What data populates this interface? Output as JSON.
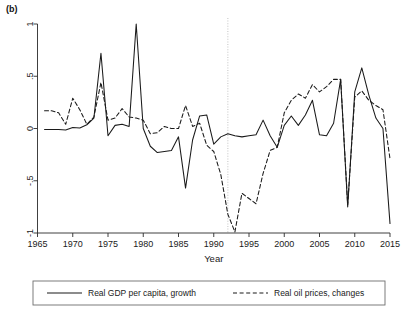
{
  "panel": {
    "label": "(b)"
  },
  "chart_data": {
    "type": "line",
    "title": "",
    "xlabel": "Year",
    "ylabel": "",
    "xlim": [
      1965,
      2015
    ],
    "ylim": [
      -1,
      1
    ],
    "grid": false,
    "legend_position": "bottom",
    "xticks": [
      1965,
      1970,
      1975,
      1980,
      1985,
      1990,
      1995,
      2000,
      2005,
      2010,
      2015
    ],
    "xtick_labels": [
      "1965",
      "1970",
      "1975",
      "1980",
      "1985",
      "1990",
      "1995",
      "2000",
      "2005",
      "2010",
      "2015"
    ],
    "yticks": [
      1,
      0.5,
      0,
      -0.5,
      -1
    ],
    "ytick_labels": [
      "1",
      ".5",
      "0",
      "-.5",
      "-1"
    ],
    "annotations": [
      {
        "name": "reference-line-1992",
        "type": "vline",
        "x": 1992,
        "style": "dotted",
        "color": "#c8c8c8"
      }
    ],
    "x": [
      1966,
      1967,
      1968,
      1969,
      1970,
      1971,
      1972,
      1973,
      1974,
      1975,
      1976,
      1977,
      1978,
      1979,
      1980,
      1981,
      1982,
      1983,
      1984,
      1985,
      1986,
      1987,
      1988,
      1989,
      1990,
      1991,
      1992,
      1993,
      1994,
      1995,
      1996,
      1997,
      1998,
      1999,
      2000,
      2001,
      2002,
      2003,
      2004,
      2005,
      2006,
      2007,
      2008,
      2009,
      2010,
      2011,
      2012,
      2013,
      2014,
      2015
    ],
    "series": [
      {
        "name": "Real GDP per capita, growth",
        "style": "solid",
        "color": "#1a1a1a",
        "values": [
          -0.01,
          -0.01,
          -0.01,
          -0.015,
          0.01,
          0.005,
          0.035,
          0.1,
          0.72,
          -0.07,
          0.03,
          0.04,
          0.02,
          1.0,
          0.0,
          -0.17,
          -0.23,
          -0.22,
          -0.21,
          -0.08,
          -0.57,
          -0.11,
          0.12,
          0.13,
          -0.15,
          -0.08,
          -0.05,
          -0.07,
          -0.08,
          -0.07,
          -0.06,
          0.08,
          -0.07,
          -0.18,
          0.03,
          0.12,
          0.03,
          0.13,
          0.27,
          -0.06,
          -0.07,
          0.05,
          0.16,
          0.25,
          0.35,
          0.23,
          0.2,
          0.13,
          0.47,
          -0.75
        ]
      },
      {
        "name": "Real oil prices, changes",
        "style": "dashed",
        "color": "#1a1a1a",
        "values": [
          0.17,
          0.17,
          0.15,
          0.04,
          0.29,
          0.18,
          0.04,
          0.11,
          0.44,
          0.08,
          0.1,
          0.19,
          0.11,
          0.1,
          0.08,
          -0.05,
          -0.04,
          0.02,
          0.0,
          0.0,
          0.22,
          0.02,
          0.05,
          -0.16,
          -0.22,
          -0.44,
          -0.82,
          -0.99,
          -0.62,
          -0.67,
          -0.72,
          -0.43,
          -0.21,
          -0.18,
          0.15,
          0.27,
          0.33,
          0.29,
          0.42,
          0.35,
          0.4,
          0.47,
          0.52,
          0.6,
          0.65,
          0.57,
          0.47,
          0.24,
          0.22,
          -0.29
        ]
      }
    ],
    "series_extra_points": {
      "note_solid_2008_2011": [
        [
          2008,
          0.47
        ],
        [
          2009,
          -0.75
        ],
        [
          2010,
          0.35
        ],
        [
          2011,
          0.58
        ],
        [
          2012,
          0.32
        ],
        [
          2013,
          0.1
        ],
        [
          2014,
          0.0
        ],
        [
          2015,
          -0.91
        ]
      ],
      "note_dashed_2008_2015": [
        [
          2008,
          0.47
        ],
        [
          2009,
          -0.73
        ],
        [
          2010,
          0.3
        ],
        [
          2011,
          0.36
        ],
        [
          2012,
          0.27
        ],
        [
          2013,
          0.22
        ],
        [
          2014,
          0.18
        ],
        [
          2015,
          -0.29
        ]
      ]
    }
  },
  "legend": {
    "entries": [
      {
        "label": "Real GDP per capita, growth",
        "style": "solid"
      },
      {
        "label": "Real oil prices, changes",
        "style": "dashed"
      }
    ]
  }
}
